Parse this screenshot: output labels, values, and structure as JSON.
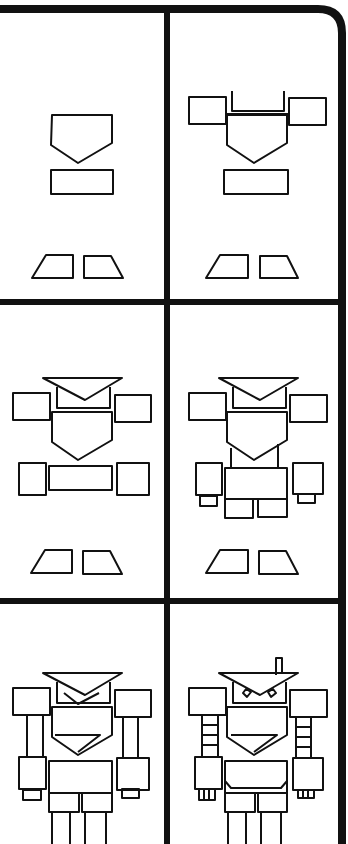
{
  "colors": {
    "ink": "#111111",
    "paper": "#ffffff"
  },
  "panels": [
    {
      "step": 1,
      "label": "Step 1: chest, waist and feet"
    },
    {
      "step": 2,
      "label": "Step 2: shoulders and neck"
    },
    {
      "step": 3,
      "label": "Step 3: head and hands"
    },
    {
      "step": 4,
      "label": "Step 4: torso, hips and fingers"
    },
    {
      "step": 5,
      "label": "Step 5: arms and legs"
    },
    {
      "step": 6,
      "label": "Step 6: details, eyes and antenna"
    }
  ]
}
